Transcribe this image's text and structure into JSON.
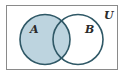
{
  "diagram": {
    "type": "venn",
    "universe_label": "U",
    "sets": [
      {
        "label": "A",
        "shaded": true
      },
      {
        "label": "B",
        "shaded": false
      }
    ],
    "shaded_region": "A",
    "colors": {
      "fill": "#bdd4df",
      "stroke": "#2f5866",
      "border": "#8a8a8a",
      "background": "#ffffff"
    }
  }
}
